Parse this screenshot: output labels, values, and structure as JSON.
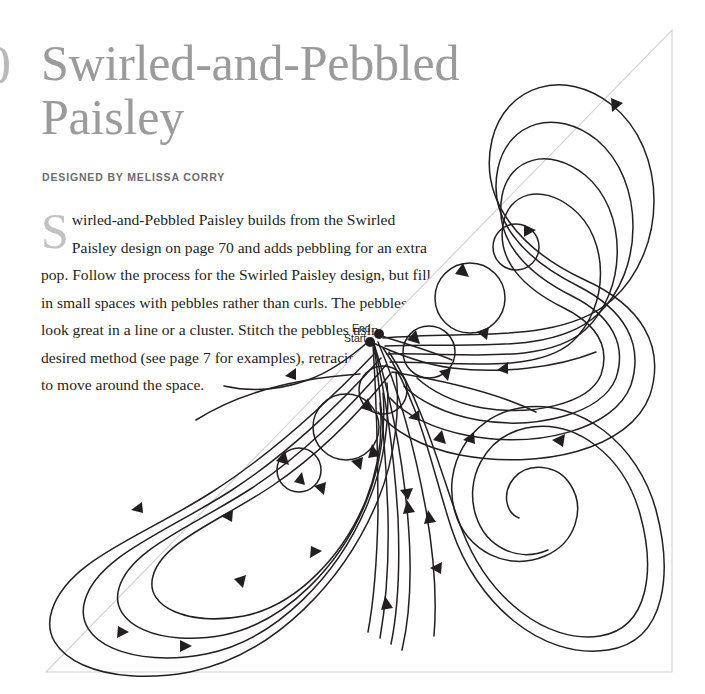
{
  "page": {
    "folio_partial": "0",
    "background": "#ffffff"
  },
  "header": {
    "title": "Swirled-and-Pebbled Paisley",
    "byline": "DESIGNED BY MELISSA CORRY",
    "title_color": "#9b9b9b",
    "byline_color": "#6c6c6c"
  },
  "body": {
    "dropcap": "S",
    "text": "wirled-and-Pebbled Paisley builds from the Swirled Paisley design on page 70 and adds pebbling for an extra pop. Follow the process for the Swirled Paisley design, but fill in small spaces with pebbles rather than curls. The pebbles look great in a line or a cluster. Stitch the pebbles using your desired method (see page 7 for examples), retracing as needed to move around the space.",
    "text_color": "#231f20",
    "dropcap_color": "#c2c2c2",
    "lines": [
      "wirled-and-Pebbled Paisley builds from the Swirled",
      "Paisley design on page 70 and adds pebbling for an",
      "extra pop. Follow the process for the Swirled Paisley",
      "design, but fill in small spaces with pebbles",
      "rather than curls. The pebbles look great",
      "in a line or a cluster. Stitch the pebbles",
      "using your desired method (see page 7",
      "for examples), retracing as needed",
      "to move around the space."
    ]
  },
  "diagram": {
    "shape": "right triangle",
    "stroke_color": "#231f20",
    "outline_color": "#d2d2d2",
    "labels": {
      "end": "End.",
      "start": "Start."
    },
    "triangle": {
      "apex": [
        672,
        30
      ],
      "bottom_right": [
        672,
        672
      ],
      "bottom_left": [
        46,
        672
      ]
    },
    "start_point": [
      370,
      341
    ],
    "end_point": [
      379,
      334
    ],
    "pebbles": [
      {
        "cx": 516,
        "cy": 247,
        "r": 23
      },
      {
        "cx": 470,
        "cy": 298,
        "r": 35
      },
      {
        "cx": 429,
        "cy": 352,
        "r": 26
      },
      {
        "cx": 383,
        "cy": 390,
        "r": 24
      },
      {
        "cx": 346,
        "cy": 427,
        "r": 33
      },
      {
        "cx": 299,
        "cy": 470,
        "r": 22
      }
    ],
    "motifs": [
      {
        "name": "upper-paisley",
        "type": "nested-teardrop",
        "loops": 4
      },
      {
        "name": "lower-left-paisley",
        "type": "nested-teardrop",
        "loops": 4
      },
      {
        "name": "right-spiral",
        "type": "spiral",
        "turns": 2.5,
        "center": [
          560,
          490
        ]
      }
    ]
  }
}
